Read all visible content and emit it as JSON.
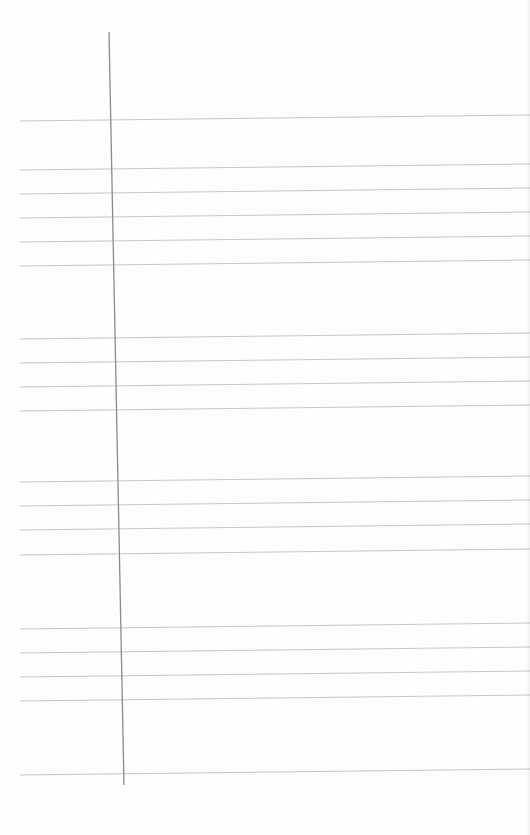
{
  "document": {
    "type": "ruled-form-page",
    "description": "Blank lined page with a vertical margin rule; no legible text",
    "text_content": ""
  },
  "colors": {
    "paper": "#fefefe",
    "margin_rule": "#8a8a8a",
    "horizontal_rule": "#b8b8b8"
  },
  "margin_rule": {
    "x1": 109,
    "y1": 32,
    "x2": 124,
    "y2": 785
  },
  "horizontal_rules": {
    "x_start": 20,
    "x_end": 530,
    "right_edge_rise": 6,
    "groups": [
      {
        "name": "block-1",
        "y": [
          121,
          170,
          194,
          218,
          242,
          266
        ]
      },
      {
        "name": "block-2",
        "y": [
          339,
          363,
          387,
          411
        ]
      },
      {
        "name": "block-3",
        "y": [
          482,
          506,
          530,
          555
        ]
      },
      {
        "name": "block-4",
        "y": [
          629,
          653,
          677,
          701
        ]
      },
      {
        "name": "block-5",
        "y": [
          775
        ]
      }
    ]
  }
}
